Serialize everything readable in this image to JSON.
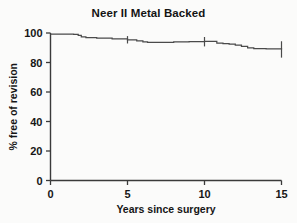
{
  "chart_data": {
    "type": "line",
    "title": "Neer II Metal Backed",
    "subtitle": "",
    "xlabel": "Years since surgery",
    "ylabel": "% free of revision",
    "xlim": [
      0,
      15
    ],
    "ylim": [
      0,
      100
    ],
    "xticks": [
      0,
      5,
      10,
      15
    ],
    "xtick_labels": [
      "0",
      "5",
      "10",
      "15"
    ],
    "yticks": [
      0,
      20,
      40,
      60,
      80,
      100
    ],
    "ytick_labels": [
      "0",
      "20",
      "40",
      "60",
      "80",
      "100"
    ],
    "grid": false,
    "legend": null,
    "series": [
      {
        "name": "Neer II Metal Backed survivorship",
        "step": true,
        "x": [
          0.0,
          0.6,
          1.0,
          1.5,
          1.8,
          2.0,
          2.3,
          3.0,
          4.0,
          5.0,
          5.6,
          6.0,
          6.3,
          7.0,
          8.0,
          9.0,
          10.0,
          10.4,
          10.8,
          11.2,
          11.6,
          12.0,
          12.4,
          12.8,
          13.2,
          14.0,
          15.0
        ],
        "y": [
          99.3,
          99.3,
          99.3,
          99.0,
          98.4,
          97.3,
          96.9,
          96.5,
          96.0,
          95.4,
          94.6,
          94.0,
          93.7,
          93.7,
          93.9,
          94.1,
          94.3,
          94.3,
          93.2,
          92.8,
          92.4,
          91.7,
          90.9,
          89.9,
          89.4,
          89.2,
          88.8
        ]
      }
    ],
    "confidence_intervals": [
      {
        "x": 5.0,
        "y": 95.4,
        "lower": 92.9,
        "upper": 97.9
      },
      {
        "x": 10.0,
        "y": 94.3,
        "lower": 90.9,
        "upper": 97.3
      },
      {
        "x": 15.0,
        "y": 88.8,
        "lower": 83.3,
        "upper": 94.4
      }
    ],
    "colors": {
      "curve": "#4a4a4a",
      "axis": "#3a3a3a",
      "text": "#161616",
      "background": "#fbfbfa"
    }
  }
}
